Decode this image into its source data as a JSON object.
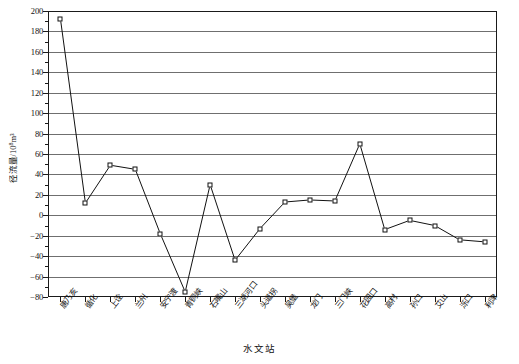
{
  "chart_data": {
    "type": "line",
    "title": "",
    "xlabel": "水文站",
    "ylabel": "径流量/10⁸m³",
    "ylabel_base": "径流量/10",
    "ylabel_sup": "8",
    "ylabel_unit": "m³",
    "ylim": [
      -80,
      200
    ],
    "ytick_step": 20,
    "ytick_labels": [
      "200",
      "180",
      "160",
      "140",
      "120",
      "100",
      "80",
      "60",
      "40",
      "20",
      "0",
      "−20",
      "−40",
      "−60",
      "−80"
    ],
    "ytick_values": [
      200,
      180,
      160,
      140,
      120,
      100,
      80,
      60,
      40,
      20,
      0,
      -20,
      -40,
      -60,
      -80
    ],
    "grid": true,
    "grid_axis": "y",
    "legend": "none",
    "marker": "open-square",
    "line_color": "#111111",
    "grid_color": "#6f6f6f",
    "categories": [
      "唐乃亥",
      "循化",
      "上诠",
      "兰州",
      "安宁渡",
      "青铜峡",
      "石嘴山",
      "三湖河口",
      "头道拐",
      "吴堡",
      "龙门",
      "三门峡",
      "花园口",
      "高村",
      "孙口",
      "艾山",
      "泺口",
      "利津"
    ],
    "values": [
      192,
      12,
      49,
      45,
      -18,
      -75,
      30,
      -44,
      -13,
      13,
      15,
      14,
      70,
      -14,
      -5,
      -10,
      -24,
      -26
    ]
  }
}
